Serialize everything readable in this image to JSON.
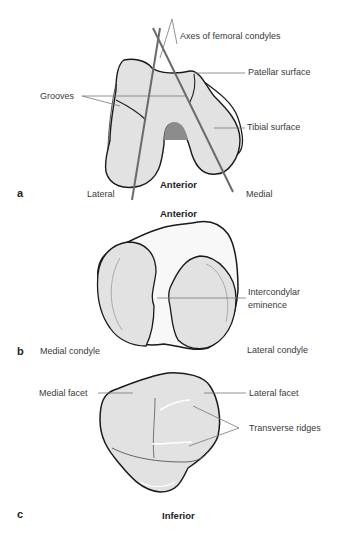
{
  "figure": {
    "panels": [
      {
        "letter": "a",
        "orientation": "Anterior",
        "side_left": "Lateral",
        "side_right": "Medial",
        "labels": {
          "axes": "Axes of femoral condyles",
          "patellar": "Patellar surface",
          "grooves": "Grooves",
          "tibial": "Tibial surface"
        }
      },
      {
        "letter": "b",
        "orientation": "Anterior",
        "labels": {
          "eminence_line1": "Intercondylar",
          "eminence_line2": "eminence",
          "medial": "Medial condyle",
          "lateral": "Lateral condyle"
        }
      },
      {
        "letter": "c",
        "orientation": "Inferior",
        "labels": {
          "medial_facet": "Medial facet",
          "lateral_facet": "Lateral facet",
          "ridges": "Transverse ridges"
        }
      }
    ],
    "colors": {
      "bone_fill": "#e2e2e2",
      "outline": "#1a1a1a",
      "axis_line": "#6b6b6b",
      "leader": "#777777"
    }
  }
}
